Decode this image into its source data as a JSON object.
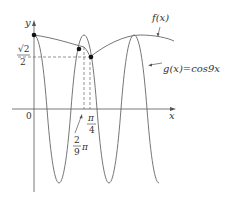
{
  "figure": {
    "axes": {
      "x_label": "x",
      "y_label": "y",
      "origin_label": "0"
    },
    "y_tick": {
      "num": "√2",
      "den": "2"
    },
    "x_ticks": [
      {
        "num": "2",
        "den": "9",
        "suffix": "π"
      },
      {
        "num": "π",
        "den": "4"
      }
    ],
    "curves": {
      "f_label": "f(x)",
      "g_label": "g(x)=cos9x"
    },
    "colors": {
      "line": "#555555",
      "text": "#333333",
      "point": "#111111"
    }
  }
}
